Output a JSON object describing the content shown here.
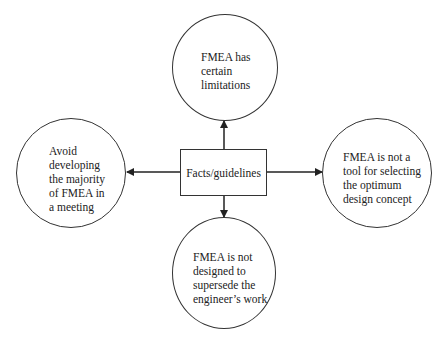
{
  "diagram": {
    "center": {
      "label": "Facts/guidelines"
    },
    "nodes": [
      {
        "id": "top",
        "lines": [
          "FMEA has",
          "certain",
          "limitations"
        ]
      },
      {
        "id": "left",
        "lines": [
          "Avoid",
          "developing",
          "the majority",
          "of FMEA in",
          "a meeting"
        ]
      },
      {
        "id": "right",
        "lines": [
          "FMEA is not a",
          "tool for selecting",
          "the optimum",
          "design concept"
        ]
      },
      {
        "id": "bottom",
        "lines": [
          "FMEA is not",
          "designed to",
          "supersede the",
          "engineer’s work"
        ]
      }
    ],
    "edges": [
      {
        "from": "center",
        "to": "top",
        "arrow": "end"
      },
      {
        "from": "center",
        "to": "left",
        "arrow": "end"
      },
      {
        "from": "center",
        "to": "right",
        "arrow": "end"
      },
      {
        "from": "center",
        "to": "bottom",
        "arrow": "end"
      }
    ],
    "colors": {
      "stroke": "#333333",
      "text": "#222222",
      "background": "#ffffff"
    }
  }
}
